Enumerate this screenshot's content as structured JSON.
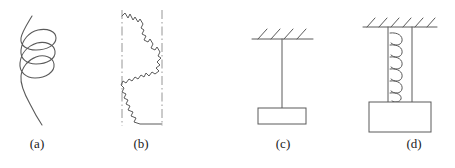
{
  "figure": {
    "background_color": "#ffffff",
    "stroke_color": "#5a5a5a",
    "label_color": "#1a1a1a",
    "width": 455,
    "height": 168
  },
  "panels": [
    {
      "id": "a",
      "caption": "(a)",
      "icon_name": "helical-coil-curve",
      "description": "free helical coil drawn as a continuous spiral with three loops and open tails at top and bottom",
      "loop_count": 3,
      "stroke_color": "#5a5a5a",
      "stroke_width": 1.1
    },
    {
      "id": "b",
      "caption": "(b)",
      "icon_name": "random-walk-chain-between-guides",
      "description": "irregular zigzag random-walk chain confined between two vertical dash-dot guide lines",
      "guide_lines": 2,
      "guide_style": "dash-dot",
      "stroke_color": "#5a5a5a",
      "stroke_width": 1.0
    },
    {
      "id": "c",
      "caption": "(c)",
      "icon_name": "mass-on-thin-string",
      "description": "rectangular mass suspended by a single thin vertical string from a hatched fixed ceiling",
      "hatch_count": 4,
      "block_width": 48,
      "block_height": 16,
      "stroke_color": "#5a5a5a",
      "stroke_width": 1.0
    },
    {
      "id": "d",
      "caption": "(d)",
      "icon_name": "mass-on-coiled-column",
      "description": "rectangular mass suspended from a hatched ceiling by a wide column containing stacked wavy coil segments",
      "hatch_count": 6,
      "coil_segments": 6,
      "block_width": 62,
      "block_height": 30,
      "stroke_color": "#5a5a5a",
      "stroke_width": 1.0
    }
  ]
}
